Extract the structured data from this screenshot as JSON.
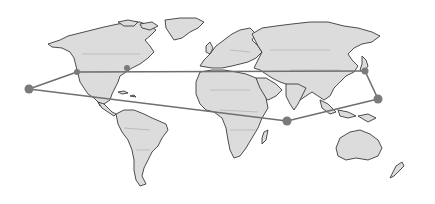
{
  "map": {
    "type": "world-map",
    "style": "grayscale",
    "colors": {
      "land": "#dcdcdc",
      "coast": "#3a3a3a",
      "route": "#6f6f6f",
      "node": "#7a7a7a",
      "background": "#ffffff"
    },
    "nodes": [
      {
        "id": "pacific-west",
        "x": 29,
        "y": 89
      },
      {
        "id": "north-america-west",
        "x": 77,
        "y": 72
      },
      {
        "id": "north-america-east",
        "x": 127,
        "y": 68
      },
      {
        "id": "east-asia",
        "x": 365,
        "y": 71
      },
      {
        "id": "western-pacific",
        "x": 378,
        "y": 99
      },
      {
        "id": "indian-ocean",
        "x": 287,
        "y": 121
      }
    ],
    "routes": [
      {
        "from": "pacific-west",
        "to": "north-america-west"
      },
      {
        "from": "north-america-west",
        "to": "east-asia"
      },
      {
        "from": "east-asia",
        "to": "western-pacific"
      },
      {
        "from": "western-pacific",
        "to": "indian-ocean"
      },
      {
        "from": "indian-ocean",
        "to": "pacific-west"
      }
    ]
  }
}
